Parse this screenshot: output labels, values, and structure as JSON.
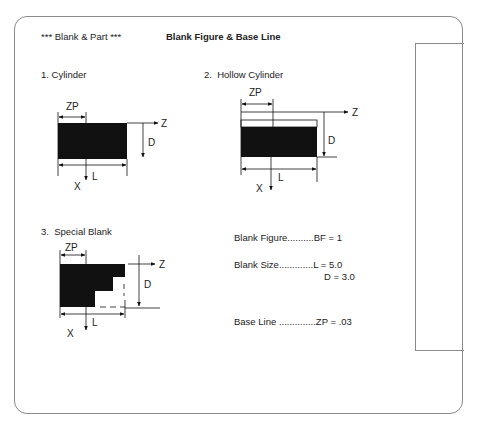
{
  "header": {
    "section_label": "*** Blank & Part ***",
    "title": "Blank Figure & Base Line"
  },
  "figures": [
    {
      "label": "1. Cylinder",
      "axis_labels": {
        "zp": "ZP",
        "z": "Z",
        "d": "D",
        "x": "X",
        "l": "L"
      }
    },
    {
      "label": "2.  Hollow Cylinder",
      "axis_labels": {
        "zp": "ZP",
        "z": "Z",
        "d": "D",
        "x": "X",
        "l": "L"
      }
    },
    {
      "label": "3.  Special Blank",
      "axis_labels": {
        "zp": "ZP",
        "z": "Z",
        "d": "D",
        "x": "X",
        "l": "L"
      }
    }
  ],
  "parameters": {
    "blank_figure": "Blank Figure..........BF = 1",
    "blank_size_l": "Blank Size.............L = 5.0",
    "blank_size_d": "D = 3.0",
    "base_line": "Base Line ..............ZP = .03"
  },
  "colors": {
    "frame": "#8a8a8a",
    "ink": "#111111",
    "background": "#ffffff"
  }
}
